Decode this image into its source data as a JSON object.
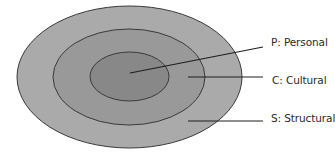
{
  "diagram": {
    "type": "concentric-ellipses",
    "colors": {
      "outer_fill": "#aaaaaa",
      "middle_fill": "#999999",
      "inner_fill": "#888888",
      "stroke": "#3a3a3a",
      "leader": "#1e1e1e",
      "text": "#2a2a2a"
    },
    "layers": [
      {
        "id": "structural",
        "label": "S: Structural",
        "level": "outer"
      },
      {
        "id": "cultural",
        "label": "C: Cultural",
        "level": "middle"
      },
      {
        "id": "personal",
        "label": "P: Personal",
        "level": "inner"
      }
    ]
  }
}
